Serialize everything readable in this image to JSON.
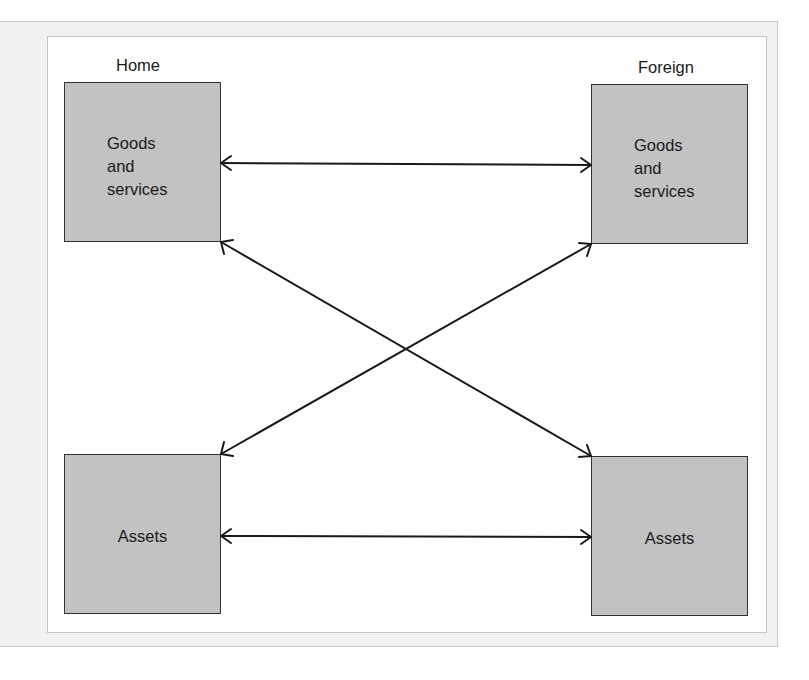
{
  "diagram": {
    "regions": {
      "home": {
        "label": "Home"
      },
      "foreign": {
        "label": "Foreign"
      }
    },
    "nodes": {
      "home_goods": {
        "label": "Goods\nand\nservices"
      },
      "foreign_goods": {
        "label": "Goods\nand\nservices"
      },
      "home_assets": {
        "label": "Assets"
      },
      "foreign_assets": {
        "label": "Assets"
      }
    },
    "edges": [
      {
        "from": "Home Goods and services",
        "to": "Foreign Goods and services",
        "type": "bidirectional"
      },
      {
        "from": "Home Assets",
        "to": "Foreign Assets",
        "type": "bidirectional"
      },
      {
        "from": "Home Goods and services",
        "to": "Foreign Assets",
        "type": "bidirectional"
      },
      {
        "from": "Home Assets",
        "to": "Foreign Goods and services",
        "type": "bidirectional"
      }
    ],
    "colors": {
      "node_fill": "#c2c2c2",
      "node_border": "#333333",
      "arrow": "#1a1a1a",
      "outer_panel": "#f1f1f1",
      "inner_panel": "#ffffff"
    }
  }
}
